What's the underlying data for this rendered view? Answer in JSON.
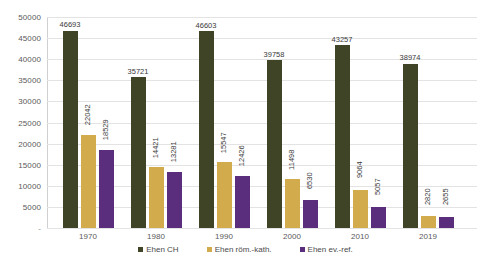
{
  "chart_data": {
    "type": "bar",
    "title": "",
    "subtitle": "",
    "xlabel": "",
    "ylabel": "",
    "grid": true,
    "legend_position": "bottom",
    "ylim": [
      0,
      50000
    ],
    "yticks": [
      "-",
      "5000",
      "10000",
      "15000",
      "20000",
      "25000",
      "30000",
      "35000",
      "40000",
      "45000",
      "50000"
    ],
    "ytick_values": [
      0,
      5000,
      10000,
      15000,
      20000,
      25000,
      30000,
      35000,
      40000,
      45000,
      50000
    ],
    "categories": [
      "1970",
      "1980",
      "1990",
      "2000",
      "2010",
      "2019"
    ],
    "series": [
      {
        "name": "Ehen CH",
        "color": "#3f4426",
        "values": [
          46693,
          35721,
          46603,
          39758,
          43257,
          38974
        ],
        "labels": [
          "46693",
          "35721",
          "46603",
          "39758",
          "43257",
          "38974"
        ],
        "label_orientation": "horizontal"
      },
      {
        "name": "Ehen röm.-kath.",
        "color": "#d2ab4c",
        "values": [
          22042,
          14421,
          15547,
          11498,
          9064,
          2820
        ],
        "labels": [
          "22042",
          "14421",
          "15547",
          "11498",
          "9064",
          "2820"
        ],
        "label_orientation": "vertical"
      },
      {
        "name": "Ehen ev.-ref.",
        "color": "#5a2d7d",
        "values": [
          18529,
          13281,
          12426,
          6530,
          5057,
          2655
        ],
        "labels": [
          "18529",
          "13281",
          "12426",
          "6530",
          "5057",
          "2655"
        ],
        "label_orientation": "vertical"
      }
    ]
  }
}
